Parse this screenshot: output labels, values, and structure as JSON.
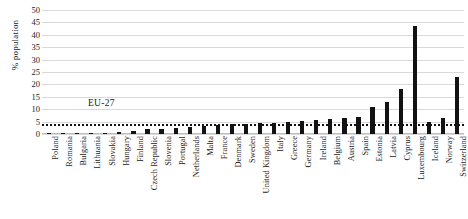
{
  "chart_data": {
    "type": "bar",
    "title": "",
    "xlabel": "",
    "ylabel": "% population",
    "ylim": [
      0,
      50
    ],
    "yticks": [
      0,
      5,
      10,
      15,
      20,
      25,
      30,
      35,
      40,
      45,
      50
    ],
    "grid": true,
    "legend": "none",
    "bar_color": "#121212",
    "gridline_color": "#d9d9d9",
    "categories": [
      "Poland",
      "Romania",
      "Bulgaria",
      "Lithuania",
      "Slovakia",
      "Hungary",
      "Finland",
      "Czech Republic",
      "Slovenia",
      "Portugal",
      "Netherlands",
      "Malta",
      "France",
      "Denmark",
      "Sweden",
      "United Kingdom",
      "Italy",
      "Greece",
      "Germany",
      "Ireland",
      "Belgium",
      "Austria",
      "Spain",
      "Estonia",
      "Latvia",
      "Cyprus",
      "Luxembourg",
      "Iceland",
      "Norway",
      "Switzerland"
    ],
    "values": [
      0.2,
      0.2,
      0.3,
      0.4,
      0.6,
      0.8,
      1.2,
      2.0,
      2.2,
      2.4,
      3.0,
      3.2,
      3.6,
      4.0,
      4.2,
      4.4,
      4.6,
      5.0,
      5.4,
      5.8,
      6.2,
      6.6,
      7.0,
      11.0,
      13.0,
      18.0,
      43.5,
      5.0,
      6.5,
      23.0
    ],
    "reference_line": {
      "label": "EU-27",
      "value": 4.0,
      "style": "dotted"
    }
  }
}
